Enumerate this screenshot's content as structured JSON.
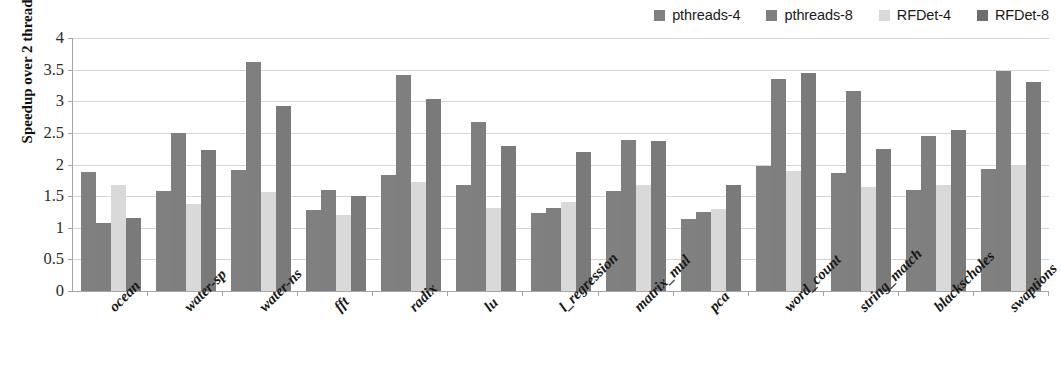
{
  "chart_data": {
    "type": "bar",
    "title": "",
    "xlabel": "",
    "ylabel": "Speedup over 2 threads",
    "ylim": [
      0,
      4
    ],
    "ytick_step": 0.5,
    "ytick_labels": [
      "4",
      "3.5",
      "3",
      "2.5",
      "2",
      "1.5",
      "1",
      "0.5",
      "0"
    ],
    "ytick_values": [
      4,
      3.5,
      3,
      2.5,
      2,
      1.5,
      1,
      0.5,
      0
    ],
    "grid": true,
    "legend_position": "top-right",
    "categories": [
      "ocean",
      "water-sp",
      "water-ns",
      "fft",
      "radix",
      "lu",
      "l_regression",
      "matrix_mul",
      "pca",
      "word_count",
      "string_match",
      "blackscholes",
      "swaptions"
    ],
    "series": [
      {
        "name": "pthreads-4",
        "color": "#808080",
        "values": [
          1.88,
          1.58,
          1.92,
          1.28,
          1.83,
          1.68,
          1.23,
          1.58,
          1.14,
          1.98,
          1.87,
          1.6,
          1.93
        ]
      },
      {
        "name": "pthreads-8",
        "color": "#7f7f7f",
        "values": [
          1.08,
          2.5,
          3.62,
          1.6,
          3.42,
          2.67,
          1.32,
          2.38,
          1.25,
          3.35,
          3.17,
          2.45,
          3.48
        ]
      },
      {
        "name": "RFDet-4",
        "color": "#d9d9d9",
        "values": [
          1.68,
          1.37,
          1.57,
          1.2,
          1.73,
          1.32,
          1.4,
          1.68,
          1.3,
          1.9,
          1.65,
          1.68,
          1.98
        ]
      },
      {
        "name": "RFDet-8",
        "color": "#7a7a7a",
        "values": [
          1.15,
          2.23,
          2.93,
          1.5,
          3.03,
          2.3,
          2.2,
          2.37,
          1.67,
          3.45,
          2.25,
          2.54,
          3.3
        ]
      }
    ]
  },
  "legend": {
    "entries": [
      {
        "label": "pthreads-4",
        "color": "#808080"
      },
      {
        "label": "pthreads-8",
        "color": "#7f7f7f"
      },
      {
        "label": "RFDet-4",
        "color": "#d9d9d9"
      },
      {
        "label": "RFDet-8",
        "color": "#6e6e6e"
      }
    ]
  },
  "colors": {
    "axis": "#a6a6a6",
    "grid": "#d6d6d6",
    "text": "#1a1a1a",
    "plot_background": "#ffffff"
  }
}
